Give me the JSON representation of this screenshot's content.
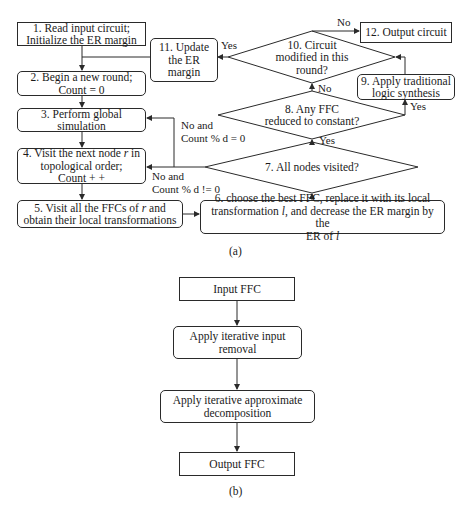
{
  "figure_a": {
    "caption": "(a)",
    "nodes": {
      "n1": {
        "line1": "1. Read input circuit;",
        "line2": "Initialize the ER margin"
      },
      "n2": {
        "line1": "2. Begin a new round;",
        "line2": "Count = 0"
      },
      "n3": {
        "line1": "3. Perform global",
        "line2": "simulation"
      },
      "n4": {
        "line1_pre": "4. Visit the next node ",
        "line1_var": "r",
        "line1_post": " in",
        "line2": "topological order;",
        "line3": "Count + +"
      },
      "n5": {
        "line1_pre": "5. Visit all the FFCs of ",
        "line1_var": "r",
        "line1_post": " and",
        "line2": "obtain their local transformations"
      },
      "n6": {
        "line1": "6. choose the best FFC, replace it with its local",
        "line2_pre": "transformation ",
        "line2_var": "l",
        "line2_post": ", and decrease the ER margin by the",
        "line3_pre": "ER of ",
        "line3_var": "l"
      },
      "n7": {
        "text": "7. All nodes visited?"
      },
      "n8": {
        "line1": "8. Any FFC",
        "line2": "reduced to constant?"
      },
      "n9": {
        "line1": "9. Apply traditional",
        "line2": "logic synthesis"
      },
      "n10": {
        "line1": "10. Circuit",
        "line2": "modified in this",
        "line3": "round?"
      },
      "n11": {
        "line1": "11. Update",
        "line2": "the ER",
        "line3": "margin"
      },
      "n12": {
        "text": "12. Output circuit"
      }
    },
    "edge_labels": {
      "n10_no": "No",
      "n10_yes": "Yes",
      "n8_no": "No",
      "n8_yes": "Yes",
      "n7_yes": "Yes",
      "n7_no_eq_line1": "No and",
      "n7_no_eq_line2": "Count % d = 0",
      "n7_no_neq_line1": "No and",
      "n7_no_neq_line2": "Count % d != 0"
    }
  },
  "figure_b": {
    "caption": "(b)",
    "nodes": {
      "b1": {
        "text": "Input FFC"
      },
      "b2": {
        "line1": "Apply iterative input",
        "line2": "removal"
      },
      "b3": {
        "line1": "Apply iterative approximate",
        "line2": "decomposition"
      },
      "b4": {
        "text": "Output FFC"
      }
    }
  },
  "colors": {
    "stroke": "#2a2a2a",
    "background": "#ffffff",
    "text": "#1a1a1a"
  }
}
